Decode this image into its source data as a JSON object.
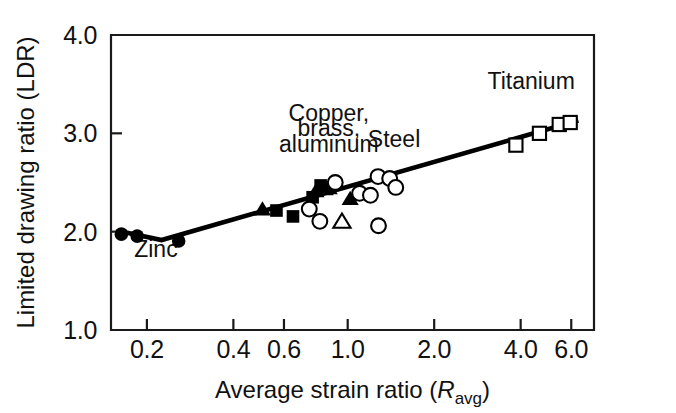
{
  "chart_data": {
    "type": "scatter",
    "title": "",
    "xlabel": "Average strain ratio (R_avg)",
    "xlabel_main": "Average strain ratio (",
    "xlabel_symbol": "R",
    "xlabel_subscript": "avg",
    "xlabel_close": ")",
    "ylabel": "Limited drawing ratio (LDR)",
    "xscale": "log",
    "yscale": "linear",
    "xlim": [
      0.15,
      7.2
    ],
    "ylim": [
      1.0,
      4.0
    ],
    "xticks": [
      0.2,
      0.4,
      0.6,
      1.0,
      2.0,
      4.0,
      6.0
    ],
    "xticklabels": [
      "0.2",
      "0.4",
      "0.6",
      "1.0",
      "2.0",
      "4.0",
      "6.0"
    ],
    "yticks": [
      1.0,
      2.0,
      3.0,
      4.0
    ],
    "yticklabels": [
      "1.0",
      "2.0",
      "3.0",
      "4.0"
    ],
    "grid": false,
    "legend": "none",
    "annotations": [
      {
        "text": "Copper,",
        "x": 0.86,
        "y": 3.13,
        "name": "annotation-copper"
      },
      {
        "text": "brass,",
        "x": 0.86,
        "y": 2.97,
        "name": "annotation-brass"
      },
      {
        "text": "aluminum",
        "x": 0.86,
        "y": 2.81,
        "name": "annotation-aluminum"
      },
      {
        "text": "Steel",
        "x": 1.45,
        "y": 2.86,
        "name": "annotation-steel"
      },
      {
        "text": "Titanium",
        "x": 4.35,
        "y": 3.45,
        "name": "annotation-titanium"
      },
      {
        "text": "Zinc",
        "x": 0.215,
        "y": 1.74,
        "name": "annotation-zinc"
      }
    ],
    "trend_line": {
      "name": "fit-line",
      "points": [
        {
          "x": 0.158,
          "y": 2.01
        },
        {
          "x": 0.225,
          "y": 1.915
        },
        {
          "x": 6.35,
          "y": 3.13
        }
      ]
    },
    "series": [
      {
        "name": "Zinc",
        "marker": "filled-circle",
        "points": [
          {
            "x": 0.163,
            "y": 1.975
          },
          {
            "x": 0.185,
            "y": 1.955
          },
          {
            "x": 0.258,
            "y": 1.905
          }
        ]
      },
      {
        "name": "Copper, brass, aluminum (filled triangle)",
        "marker": "filled-triangle",
        "points": [
          {
            "x": 0.505,
            "y": 2.225
          },
          {
            "x": 0.775,
            "y": 2.41
          },
          {
            "x": 0.835,
            "y": 2.43
          },
          {
            "x": 0.862,
            "y": 2.44
          },
          {
            "x": 1.02,
            "y": 2.33
          }
        ]
      },
      {
        "name": "Copper, brass, aluminum (filled square)",
        "marker": "filled-square",
        "points": [
          {
            "x": 0.565,
            "y": 2.215
          },
          {
            "x": 0.645,
            "y": 2.155
          },
          {
            "x": 0.755,
            "y": 2.35
          },
          {
            "x": 0.805,
            "y": 2.47
          }
        ]
      },
      {
        "name": "Copper, brass, aluminum (open circle)",
        "marker": "open-circle",
        "points": [
          {
            "x": 0.735,
            "y": 2.23
          },
          {
            "x": 0.8,
            "y": 2.105
          },
          {
            "x": 0.905,
            "y": 2.5
          }
        ]
      },
      {
        "name": "Copper, brass, aluminum (open triangle)",
        "marker": "open-triangle",
        "points": [
          {
            "x": 0.955,
            "y": 2.1
          }
        ]
      },
      {
        "name": "Steel",
        "marker": "open-circle",
        "points": [
          {
            "x": 1.1,
            "y": 2.39
          },
          {
            "x": 1.2,
            "y": 2.37
          },
          {
            "x": 1.275,
            "y": 2.56
          },
          {
            "x": 1.4,
            "y": 2.54
          },
          {
            "x": 1.47,
            "y": 2.45
          },
          {
            "x": 1.28,
            "y": 2.06
          }
        ]
      },
      {
        "name": "Titanium",
        "marker": "open-square",
        "points": [
          {
            "x": 3.85,
            "y": 2.88
          },
          {
            "x": 4.65,
            "y": 3.0
          },
          {
            "x": 5.45,
            "y": 3.09
          },
          {
            "x": 5.95,
            "y": 3.11
          }
        ]
      }
    ]
  },
  "colors": {
    "ink": "#111111",
    "marker_fill": "#000000",
    "marker_open": "#ffffff",
    "background": "#ffffff"
  }
}
